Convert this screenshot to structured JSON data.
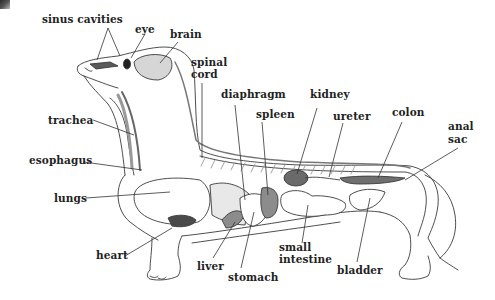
{
  "diagram": {
    "labels": {
      "sinus_cavities": "sinus cavities",
      "eye": "eye",
      "brain": "brain",
      "spinal_cord_1": "spinal",
      "spinal_cord_2": "cord",
      "trachea": "trachea",
      "diaphragm": "diaphragm",
      "kidney": "kidney",
      "spleen": "spleen",
      "ureter": "ureter",
      "colon": "colon",
      "anal_sac_1": "anal",
      "anal_sac_2": "sac",
      "esophagus": "esophagus",
      "lungs": "lungs",
      "heart": "heart",
      "liver": "liver",
      "stomach": "stomach",
      "small_intestine_1": "small",
      "small_intestine_2": "intestine",
      "bladder": "bladder"
    },
    "colors": {
      "outline": "#3a3a3a",
      "organ_dark": "#5a5a5a",
      "organ_mid": "#8c8c8c",
      "organ_light": "#bdbdbd",
      "label": "#222222"
    }
  }
}
